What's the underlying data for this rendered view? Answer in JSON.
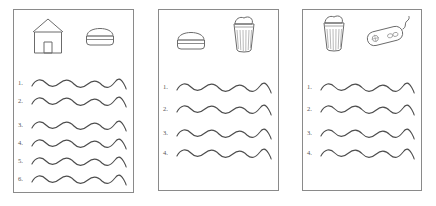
{
  "document": {
    "title": "Worksheet with three framed panels of picture prompts and wavy tracing lines",
    "background_color": "#ffffff",
    "panel_border_color": "#8a8a8a",
    "stroke_color": "#4d4d4d",
    "number_color": "#555555"
  },
  "panels": [
    {
      "id": "panel-1",
      "name": "panel-one",
      "icons": [
        {
          "name": "house-icon",
          "label": "house"
        },
        {
          "name": "burger-icon",
          "label": "hamburger"
        }
      ],
      "rows": [
        {
          "number": "1.",
          "wave": "wavy-line"
        },
        {
          "number": "2.",
          "wave": "wavy-line"
        },
        {
          "number": "3.",
          "wave": "wavy-line"
        },
        {
          "number": "4.",
          "wave": "wavy-line"
        },
        {
          "number": "5.",
          "wave": "wavy-line"
        },
        {
          "number": "6.",
          "wave": "wavy-line"
        }
      ]
    },
    {
      "id": "panel-2",
      "name": "panel-two",
      "icons": [
        {
          "name": "burger-icon",
          "label": "hamburger"
        },
        {
          "name": "drink-cup-icon",
          "label": "milkshake cup"
        }
      ],
      "rows": [
        {
          "number": "1.",
          "wave": "wavy-line"
        },
        {
          "number": "2.",
          "wave": "wavy-line"
        },
        {
          "number": "3.",
          "wave": "wavy-line"
        },
        {
          "number": "4.",
          "wave": "wavy-line"
        }
      ]
    },
    {
      "id": "panel-3",
      "name": "panel-three",
      "icons": [
        {
          "name": "drink-cup-icon",
          "label": "milkshake cup"
        },
        {
          "name": "computer-mouse-icon",
          "label": "computer mouse"
        }
      ],
      "rows": [
        {
          "number": "1.",
          "wave": "wavy-line"
        },
        {
          "number": "2.",
          "wave": "wavy-line"
        },
        {
          "number": "3.",
          "wave": "wavy-line"
        },
        {
          "number": "4.",
          "wave": "wavy-line"
        }
      ]
    }
  ]
}
